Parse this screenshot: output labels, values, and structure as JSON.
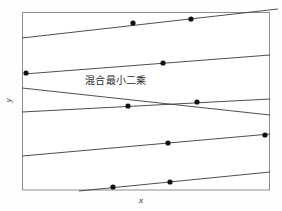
{
  "figure": {
    "background_color": "#fefefe",
    "frame_color": "#8c8c8c",
    "line_color": "#3a3a3a",
    "marker_color": "#111111"
  },
  "annotation": {
    "text": "混合最小二乘"
  },
  "axes": {
    "xlabel": "x",
    "ylabel": "y"
  },
  "chart_data": {
    "type": "scatter",
    "title": "",
    "xlabel": "x",
    "ylabel": "y",
    "grid": false,
    "legend": null,
    "axis_ticks": {
      "x": [],
      "y": []
    },
    "xlim": [
      0,
      100
    ],
    "ylim": [
      0,
      100
    ],
    "annotations": [
      {
        "text": "混合最小二乘",
        "x": 27,
        "y": 64,
        "describes": "pooled-least-squares-line"
      }
    ],
    "note": "Five steep parallel within-group regression lines (positive slope) contrasted with one shallow pooled OLS line of negative slope; pixel coordinates given in plot_px space where frame spans x 22-270, y 12-190.",
    "series": [
      {
        "name": "group-line-1",
        "type": "line",
        "slope_sign": "positive",
        "points_px": [
          [
            22,
            38
          ],
          [
            278,
            9
          ]
        ],
        "markers_px": [
          [
            133,
            23
          ],
          [
            191,
            19
          ]
        ]
      },
      {
        "name": "group-line-2",
        "type": "line",
        "slope_sign": "positive",
        "points_px": [
          [
            24,
            74
          ],
          [
            270,
            55
          ]
        ],
        "markers_px": [
          [
            26,
            73
          ],
          [
            163,
            63
          ]
        ]
      },
      {
        "name": "group-line-3",
        "type": "line",
        "slope_sign": "positive",
        "points_px": [
          [
            22,
            112
          ],
          [
            270,
            99
          ]
        ],
        "markers_px": [
          [
            128,
            106
          ],
          [
            197,
            102
          ]
        ]
      },
      {
        "name": "group-line-4",
        "type": "line",
        "slope_sign": "positive",
        "points_px": [
          [
            22,
            156
          ],
          [
            270,
            134
          ]
        ],
        "markers_px": [
          [
            168,
            143
          ],
          [
            265,
            135
          ]
        ]
      },
      {
        "name": "group-line-5",
        "type": "line",
        "slope_sign": "positive",
        "points_px": [
          [
            79,
            191
          ],
          [
            270,
            172
          ]
        ],
        "markers_px": [
          [
            113,
            187
          ],
          [
            170,
            182
          ]
        ]
      },
      {
        "name": "pooled-least-squares-line",
        "type": "line",
        "slope_sign": "negative",
        "points_px": [
          [
            22,
            88
          ],
          [
            270,
            115
          ]
        ],
        "markers_px": []
      }
    ],
    "all_markers_px": [
      [
        133,
        23
      ],
      [
        191,
        19
      ],
      [
        26,
        73
      ],
      [
        163,
        63
      ],
      [
        128,
        106
      ],
      [
        197,
        102
      ],
      [
        168,
        143
      ],
      [
        265,
        135
      ],
      [
        113,
        187
      ],
      [
        170,
        182
      ]
    ]
  }
}
